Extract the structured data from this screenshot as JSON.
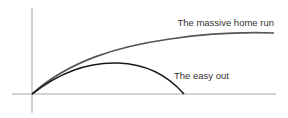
{
  "diagram": {
    "type": "trajectory-diagram",
    "axes": {
      "vertical": {
        "x": 32,
        "y1": 8,
        "y2": 113
      },
      "horizontal": {
        "y": 94,
        "x1": 12,
        "x2": 276
      },
      "color": "#a8a8a8"
    },
    "curves": [
      {
        "name": "home-run-trajectory",
        "label": "The massive home run",
        "color": "#555555",
        "path": "M32,94 C70,60 120,46 170,39 C210,33 245,32 274,33"
      },
      {
        "name": "easy-out-trajectory",
        "label": "The easy out",
        "color": "#1a1a1a",
        "path": "M32,94 C60,72 90,62 118,63 C150,64 170,78 184,94"
      }
    ],
    "labels": {
      "home_run": {
        "text": "The massive home run",
        "x": 274,
        "y": 26
      },
      "easy_out": {
        "text": "The easy out",
        "x": 174,
        "y": 79
      }
    }
  }
}
